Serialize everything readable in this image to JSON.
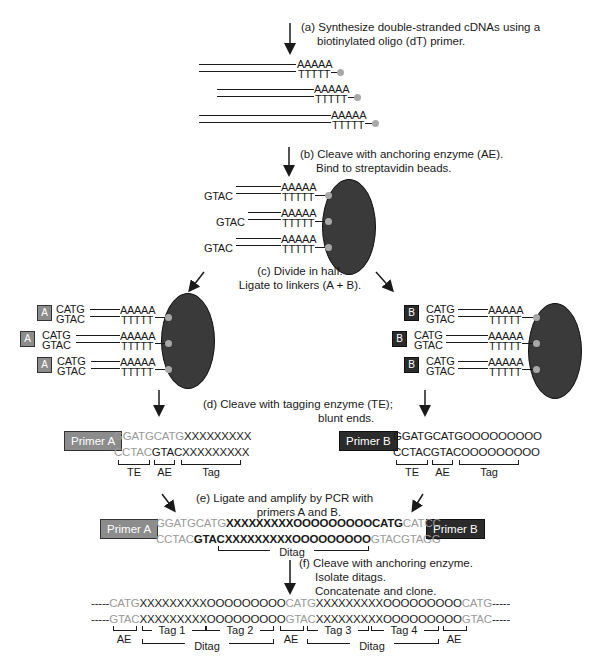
{
  "steps": {
    "a": {
      "line1": "(a) Synthesize double-stranded cDNAs using a",
      "line2": "biotinylated oligo (dT) primer."
    },
    "b": {
      "line1": "(b) Cleave with anchoring enzyme (AE).",
      "line2": "Bind to streptavidin beads."
    },
    "c": {
      "line1": "(c) Divide in half.",
      "line2": "Ligate to linkers (A + B)."
    },
    "d": {
      "line1": "(d) Cleave with tagging enzyme (TE);",
      "line2": "blunt ends."
    },
    "e": {
      "line1": "(e) Ligate and amplify by PCR with",
      "line2": "primers A and B."
    },
    "f": {
      "line1": "(f) Cleave with anchoring enzyme.",
      "line2": "Isolate ditags.",
      "line3": "Concatenate and clone."
    }
  },
  "seq": {
    "polyA": "AAAAA",
    "polyT": "TTTTT",
    "gtac": "GTAC",
    "catg": "CATG",
    "linkerA": "A",
    "linkerB": "B"
  },
  "step_d": {
    "left": {
      "primer": "Primer A",
      "top_gray": "GGATGCATG",
      "top_black": "XXXXXXXXX",
      "bot_gray": "CCTAC",
      "bot_black": "GTACXXXXXXXXX",
      "labels": [
        "TE",
        "AE",
        "Tag"
      ]
    },
    "right": {
      "primer": "Primer B",
      "top_gray": "GGATGCATG",
      "top_black": "OOOOOOOOO",
      "bot_gray": "CCTAC",
      "bot_black": "GTACOOOOOOOOO",
      "labels": [
        "TE",
        "AE",
        "Tag"
      ]
    }
  },
  "step_e": {
    "primer_left": "Primer A",
    "primer_right": "Primer B",
    "top_gray1": "GGATGCATG",
    "top_black": "XXXXXXXXXOOOOOOOOOCATG",
    "top_gray2": "CATCC",
    "bot_gray1": "CCTAC",
    "bot_black1": "GTACXXXXXXXXXOOOOOOOOO",
    "bot_gray2": "GTACGTAGG",
    "ditag_label": "Ditag"
  },
  "step_f": {
    "top": {
      "dash": "-----",
      "ae": "CATG",
      "ditag": "XXXXXXXXXOOOOOOOOO"
    },
    "bot": {
      "dash": "-----",
      "ae": "GTAC",
      "ditag": "XXXXXXXXXOOOOOOOOO"
    },
    "labels": {
      "ae": "AE",
      "tag1": "Tag 1",
      "tag2": "Tag 2",
      "tag3": "Tag 3",
      "tag4": "Tag 4",
      "ditag": "Ditag"
    }
  }
}
